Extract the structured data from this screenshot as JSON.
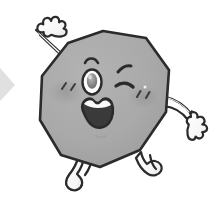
{
  "image": {
    "title": "Winking polygon cartoon character",
    "subject": "decagon-mascot",
    "background_color": "#ffffff",
    "width": 222,
    "height": 209
  },
  "palette": {
    "background": "#ffffff",
    "body_fill": "#a9a9a9",
    "body_fill_light": "#b4b4b4",
    "body_shadow": "#9a9a9a",
    "outline": "#2b2b2b",
    "limb_fill": "#fbfbfb",
    "limb_shadow": "#d8d8d8",
    "blush": "#8f8f8f",
    "eye_white": "#fdfdfd",
    "pupil": "#8d8d8d",
    "pupil_dark": "#5e5e5e",
    "mouth_inner": "#3a3a3a",
    "tooth": "#fafafa",
    "corner_artifact": "#d5d5d5"
  },
  "character": {
    "body": {
      "label": "polygon-body",
      "shape": "decagon",
      "sides": 10,
      "center": [
        108,
        99
      ],
      "radius": 68,
      "fill": "#a9a9a9",
      "stroke": "#2b2b2b",
      "stroke_width": 2.4
    },
    "face": {
      "open_eye": {
        "label": "open-eye-left",
        "center": [
          92,
          80
        ],
        "rx": 9,
        "ry": 12,
        "sclera": "#fdfdfd",
        "pupil": "#8d8d8d"
      },
      "winking_eye": {
        "label": "winking-eye-right",
        "center": [
          126,
          83
        ],
        "expression": "wink"
      },
      "eyebrow_left": {
        "label": "eyebrow-left",
        "center": [
          95,
          62
        ]
      },
      "eyebrow_right": {
        "label": "eyebrow-right",
        "center": [
          126,
          68
        ]
      },
      "mouth": {
        "label": "open-smiling-mouth",
        "center": [
          99,
          111
        ],
        "width": 34,
        "height": 30,
        "inner": "#3a3a3a",
        "teeth": "#fafafa"
      },
      "blush_left": {
        "label": "blush-left",
        "center": [
          66,
          92
        ],
        "rx": 19,
        "ry": 14
      },
      "blush_right": {
        "label": "blush-right",
        "center": [
          143,
          97
        ],
        "rx": 17,
        "ry": 13
      },
      "sparkle_left_count": 2,
      "sparkle_right_count": 2,
      "chin_mark": {
        "label": "chin-mark",
        "center": [
          101,
          135
        ]
      }
    },
    "limbs": {
      "arm_left": {
        "label": "arm-left-raised",
        "direction": "up-left",
        "hand": "mitten",
        "fingers": 4
      },
      "arm_right": {
        "label": "arm-right-extended",
        "direction": "down-right",
        "hand": "mitten",
        "fingers": 4
      },
      "leg_left": {
        "label": "leg-left",
        "direction": "down-left",
        "foot": "boot"
      },
      "leg_right": {
        "label": "leg-right",
        "direction": "down-right",
        "foot": "boot"
      }
    }
  },
  "artifacts": {
    "left_edge_triangle": {
      "label": "corner-triangle-artifact",
      "color": "#d5d5d5",
      "position": [
        0,
        68
      ],
      "size": [
        15,
        33
      ]
    }
  }
}
